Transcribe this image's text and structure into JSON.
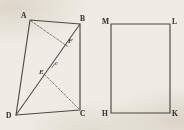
{
  "figure": {
    "caption_present": false,
    "background_color": "#f0ece4",
    "ink_color": "#4a4843",
    "left_figure": {
      "name": "quadrilateral-abcd",
      "vertices": [
        {
          "label": "A",
          "x": 30,
          "y": 20
        },
        {
          "label": "B",
          "x": 80,
          "y": 24
        },
        {
          "label": "C",
          "x": 80,
          "y": 110
        },
        {
          "label": "D",
          "x": 16,
          "y": 115
        }
      ],
      "interior_points": [
        {
          "label": "F",
          "x": 67,
          "y": 44
        },
        {
          "label": "E",
          "x": 45,
          "y": 73
        }
      ],
      "segment_labels": [
        {
          "label": "e",
          "x": 55,
          "y": 64
        }
      ],
      "solid_edges": [
        {
          "from": "A",
          "to": "B"
        },
        {
          "from": "B",
          "to": "C"
        },
        {
          "from": "C",
          "to": "D"
        },
        {
          "from": "D",
          "to": "A"
        },
        {
          "from": "D",
          "to": "B"
        }
      ],
      "dashed_edges": [
        {
          "from": "A",
          "to": "F"
        },
        {
          "from": "C",
          "to": "E"
        }
      ]
    },
    "right_figure": {
      "name": "rectangle-mlkh",
      "vertices": [
        {
          "label": "M",
          "x": 111,
          "y": 24
        },
        {
          "label": "L",
          "x": 170,
          "y": 24
        },
        {
          "label": "K",
          "x": 170,
          "y": 113
        },
        {
          "label": "H",
          "x": 111,
          "y": 113
        }
      ],
      "solid_edges": [
        {
          "from": "M",
          "to": "L"
        },
        {
          "from": "L",
          "to": "K"
        },
        {
          "from": "K",
          "to": "H"
        },
        {
          "from": "H",
          "to": "M"
        }
      ],
      "dashed_edges": [],
      "interior_points": [],
      "segment_labels": []
    }
  }
}
